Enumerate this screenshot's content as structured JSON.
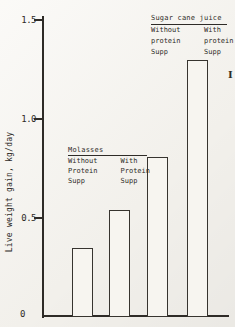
{
  "colors": {
    "paper": "#f7f5f0",
    "ink": "#2e2b27"
  },
  "chart_data": {
    "type": "bar",
    "title": "",
    "xlabel": "",
    "ylabel": "Live weight gain, kg/day",
    "ylim": [
      0,
      1.5
    ],
    "yticks": [
      "0",
      "0.5",
      "1.0",
      "1.5"
    ],
    "ytick_values": [
      0,
      0.5,
      1.0,
      1.5
    ],
    "grid": false,
    "bar_fill": "white-outline",
    "categories": [
      "Molasses / Without Protein Supp",
      "Molasses / With Protein Supp",
      "Sugar cane juice / Without protein Supp",
      "Sugar cane juice / With protein Supp"
    ],
    "values": [
      0.35,
      0.54,
      0.81,
      1.3
    ],
    "groups": [
      {
        "title": "Molasses",
        "columns": [
          [
            "Without",
            "Protein",
            "Supp"
          ],
          [
            "With",
            "Protein",
            "Supp"
          ]
        ]
      },
      {
        "title": "Sugar cane juice",
        "columns": [
          [
            "Without",
            "protein",
            "Supp"
          ],
          [
            "With",
            "protein",
            "Supp"
          ]
        ]
      }
    ],
    "annotations": {
      "error_mark": "I"
    }
  }
}
